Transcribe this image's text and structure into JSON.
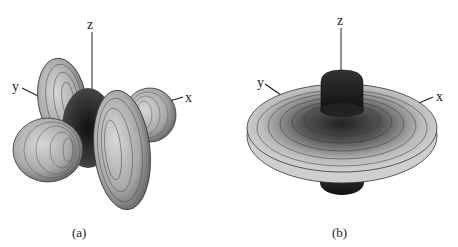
{
  "figure": {
    "panels": [
      {
        "id": "a",
        "caption": "(a)",
        "axes": {
          "z": "z",
          "y": "y",
          "x": "x"
        },
        "description": "3D lobed surface plot with four large lobes along the y and x directions"
      },
      {
        "id": "b",
        "caption": "(b)",
        "axes": {
          "z": "z",
          "y": "y",
          "x": "x"
        },
        "description": "3D disc-shaped surface plot with central lobes along the z axis"
      }
    ]
  }
}
